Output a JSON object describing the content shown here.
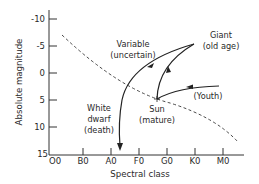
{
  "diagram": {
    "type": "hertzsprung-russell-evolution",
    "y_axis": {
      "title": "Absolute magnitude",
      "ticks": [
        "-10",
        "-5",
        "0",
        "5",
        "10",
        "15"
      ]
    },
    "x_axis": {
      "title": "Spectral class",
      "ticks": [
        "O0",
        "B0",
        "A0",
        "F0",
        "G0",
        "K0",
        "M0"
      ]
    },
    "annotations": {
      "giant_line1": "Giant",
      "giant_line2": "(old age)",
      "variable_line1": "Variable",
      "variable_line2": "(uncertain)",
      "sun_line1": "Sun",
      "sun_line2": "(mature)",
      "youth": "(Youth)",
      "white_dwarf_line1": "White",
      "white_dwarf_line2": "dwarf",
      "white_dwarf_line3": "(death)"
    },
    "main_sequence": "dashed curve",
    "evolution_path": [
      "Youth",
      "Sun (mature)",
      "Giant (old age)",
      "Variable (uncertain)",
      "White dwarf (death)"
    ],
    "colors": {
      "ink": "#2a2a2a",
      "background": "#ffffff"
    }
  }
}
